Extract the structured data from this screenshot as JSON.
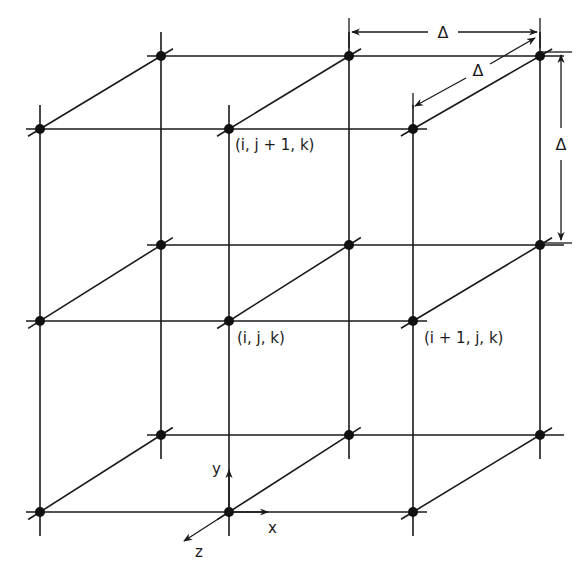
{
  "diagram": {
    "colors": {
      "line": "#1a1a1a",
      "node": "#111111",
      "background": "#ffffff"
    },
    "front_x": [
      40,
      229,
      413
    ],
    "back_x": [
      161,
      349,
      540
    ],
    "front_y": [
      129,
      321,
      512
    ],
    "back_y": [
      56,
      245,
      435
    ],
    "labels": {
      "node_up": "(i, j + 1, k)",
      "node_center": "(i, j, k)",
      "node_right": "(i + 1, j, k)"
    },
    "axes": {
      "x": "x",
      "y": "y",
      "z": "z"
    },
    "spacing": {
      "horizontal": "Δ",
      "depth": "Δ",
      "vertical": "Δ"
    }
  }
}
